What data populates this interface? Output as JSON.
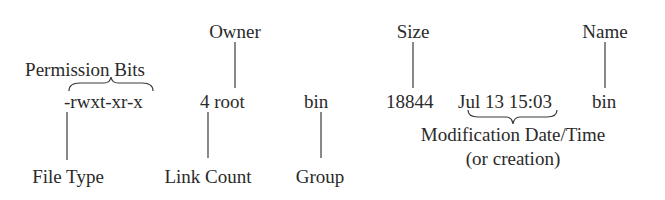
{
  "listing": {
    "permissions": "-rwxt-xr-x",
    "link_count_owner": "4 root",
    "group": "bin",
    "size": "18844",
    "datetime": "Jul 13 15:03",
    "name": "bin"
  },
  "labels": {
    "owner": "Owner",
    "permission_bits": "Permission Bits",
    "size": "Size",
    "name": "Name",
    "file_type": "File Type",
    "link_count": "Link Count",
    "group": "Group",
    "mod_time_line1": "Modification Date/Time",
    "mod_time_line2": "(or creation)"
  }
}
